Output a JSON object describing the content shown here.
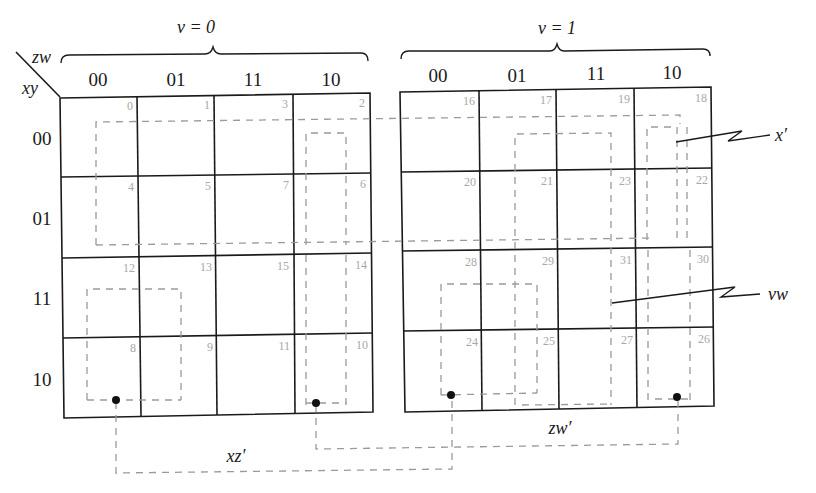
{
  "diagram": {
    "type": "five-variable-karnaugh-map",
    "axis_labels": {
      "columns": "zw",
      "rows": "xy"
    },
    "maps": [
      {
        "label": "v = 0",
        "column_headers": [
          "00",
          "01",
          "11",
          "10"
        ],
        "row_headers": [
          "00",
          "01",
          "11",
          "10"
        ],
        "cells": [
          [
            "0",
            "1",
            "3",
            "2"
          ],
          [
            "4",
            "5",
            "7",
            "6"
          ],
          [
            "12",
            "13",
            "15",
            "14"
          ],
          [
            "8",
            "9",
            "11",
            "10"
          ]
        ]
      },
      {
        "label": "v = 1",
        "column_headers": [
          "00",
          "01",
          "11",
          "10"
        ],
        "row_headers": [],
        "cells": [
          [
            "16",
            "17",
            "19",
            "18"
          ],
          [
            "20",
            "21",
            "23",
            "22"
          ],
          [
            "28",
            "29",
            "31",
            "30"
          ],
          [
            "24",
            "25",
            "27",
            "26"
          ]
        ]
      }
    ],
    "groupings": [
      {
        "term": "x′",
        "label": "x′",
        "description": "rows 00 and 01 across both maps"
      },
      {
        "term": "vw",
        "label": "vw",
        "description": "columns 01 and 11 of v = 1 map"
      },
      {
        "term": "zw′",
        "label": "zw′",
        "description": "column 10 linked between maps / v = 1 cells 24, 26"
      },
      {
        "term": "xz′",
        "label": "xz′",
        "description": "cells 8 / 10 linked across maps"
      }
    ]
  }
}
